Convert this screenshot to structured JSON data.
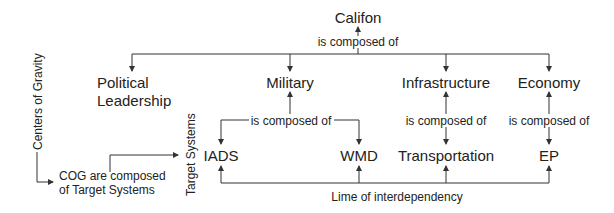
{
  "diagram": {
    "root": {
      "label": "Califon",
      "relation": "is composed of"
    },
    "centers_of_gravity": [
      {
        "label_line1": "Political",
        "label_line2": "Leadership"
      },
      {
        "label": "Military",
        "relation": "is composed of"
      },
      {
        "label": "Infrastructure",
        "relation": "is composed of"
      },
      {
        "label": "Economy",
        "relation": "is composed of"
      }
    ],
    "target_systems": [
      "IADS",
      "WMD",
      "Transportation",
      "EP"
    ],
    "side_labels": {
      "centers_of_gravity": "Centers of Gravity",
      "target_systems": "Target Systems"
    },
    "note": {
      "line1": "COG are composed",
      "line2": "of Target Systems"
    },
    "interdependency_label": "Lime of interdependency",
    "colors": {
      "line": "#333333",
      "text": "#222222",
      "background": "#ffffff"
    }
  }
}
